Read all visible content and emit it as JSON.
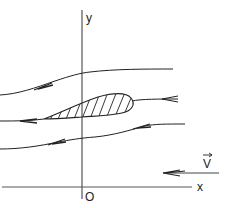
{
  "diagram": {
    "axes": {
      "x_label": "x",
      "y_label": "y",
      "origin_label": "O"
    },
    "velocity": {
      "label": "V",
      "vector_overbar": true,
      "direction": "negative-x"
    },
    "streamlines": [
      {
        "name": "upper-streamline",
        "arrow_direction": "left"
      },
      {
        "name": "stagnation-streamline",
        "arrow_direction": "left"
      },
      {
        "name": "middle-streamline",
        "arrow_direction": "left"
      },
      {
        "name": "lower-streamline",
        "arrow_direction": "left"
      }
    ],
    "body": {
      "name": "airfoil",
      "fill": "hatched"
    },
    "colors": {
      "line": "#222222",
      "background": "#ffffff"
    }
  }
}
